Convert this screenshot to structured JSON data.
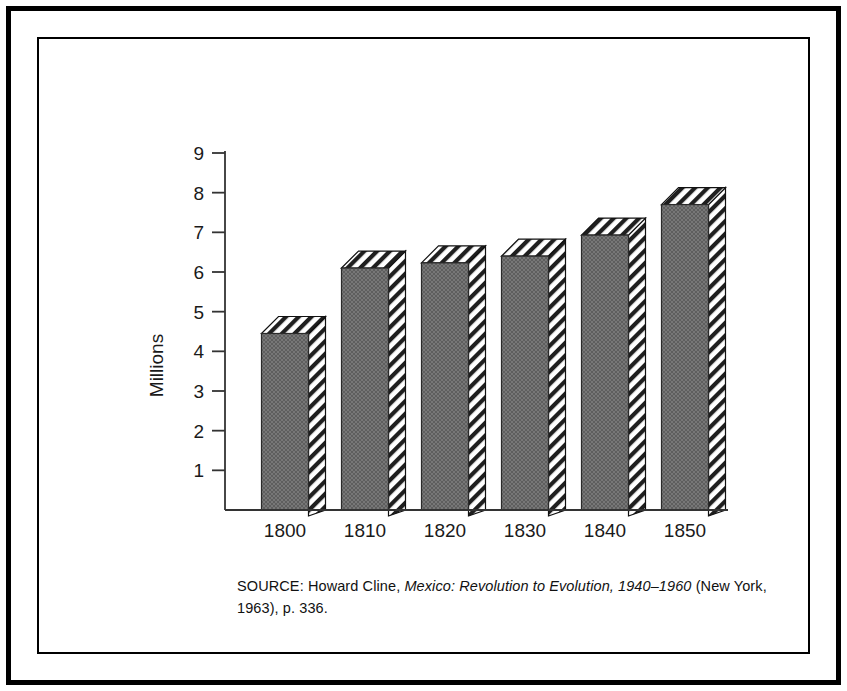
{
  "figure": {
    "source_note": {
      "prefix": "SOURCE: Howard Cline, ",
      "title_italic": "Mexico: Revolution to Evolution, 1940–1960",
      "suffix": " (New York, 1963), p. 336."
    }
  },
  "chart_data": {
    "type": "bar",
    "title": "",
    "subtitle": "",
    "xlabel": "",
    "ylabel": "Millions",
    "categories": [
      "1800",
      "1810",
      "1820",
      "1830",
      "1840",
      "1850"
    ],
    "values": [
      4.45,
      6.1,
      6.23,
      6.4,
      6.93,
      7.7
    ],
    "series": [
      {
        "name": "Population",
        "values": [
          4.45,
          6.1,
          6.23,
          6.4,
          6.93,
          7.7
        ]
      }
    ],
    "ylim": [
      0,
      9
    ],
    "yticks": [
      1,
      2,
      3,
      4,
      5,
      6,
      7,
      8,
      9
    ],
    "ytick_labels": [
      "1",
      "2",
      "3",
      "4",
      "5",
      "6",
      "7",
      "8",
      "9"
    ],
    "grid": false,
    "legend": false,
    "legend_position": "none",
    "style": {
      "bar_front_color": "#6b6b6b",
      "bar_edge_color": "#000000",
      "hatch_color": "#1a1a1a",
      "axis_color": "#333333",
      "three_d": true
    }
  }
}
